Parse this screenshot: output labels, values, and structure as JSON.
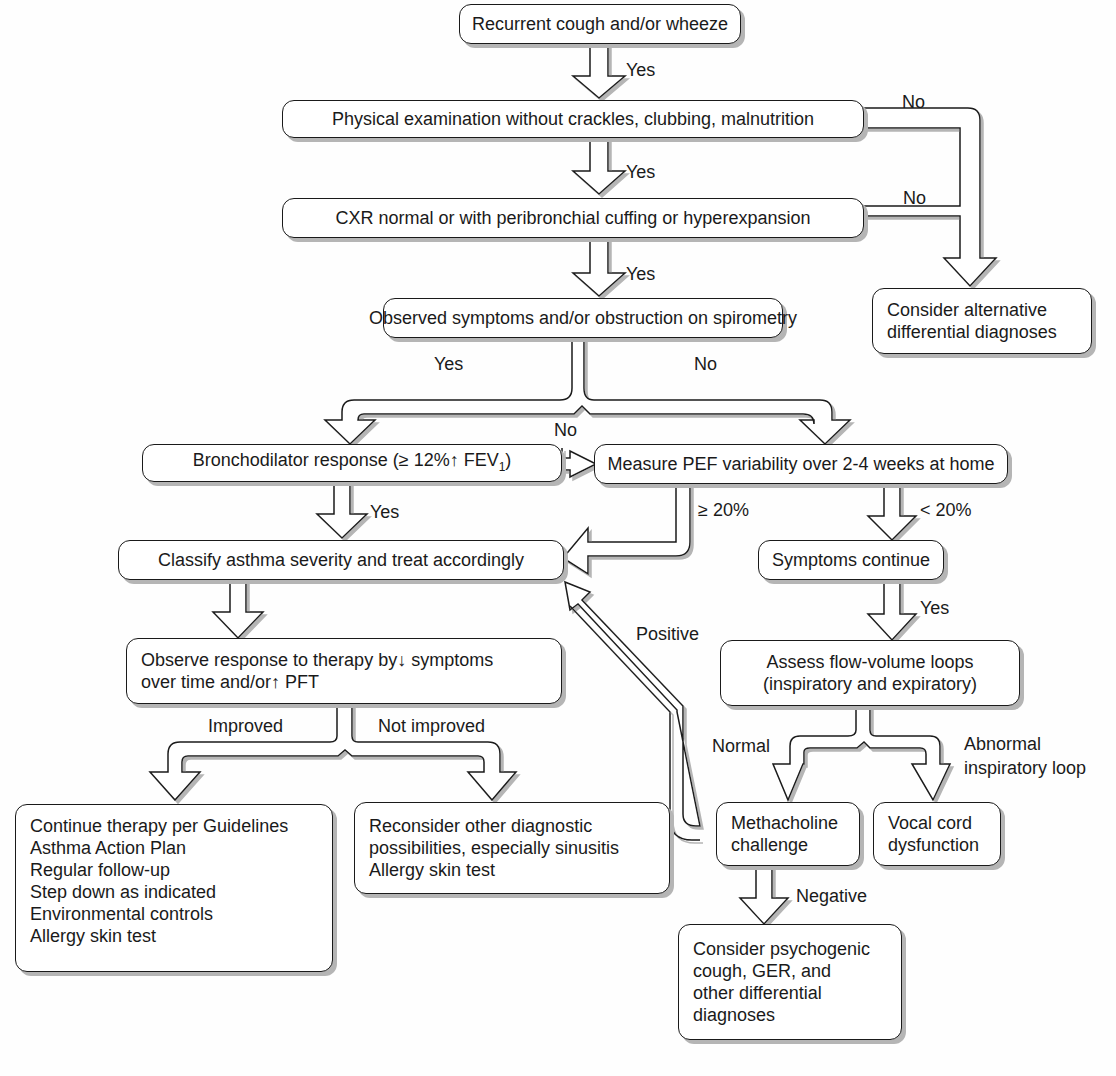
{
  "diagram": {
    "nodes": {
      "start": {
        "text": "Recurrent cough and/or wheeze"
      },
      "physical_exam": {
        "text": "Physical examination without crackles, clubbing, malnutrition"
      },
      "cxr": {
        "text": "CXR normal or with peribronchial cuffing or hyperexpansion"
      },
      "observed": {
        "text": "Observed symptoms and/or obstruction on spirometry"
      },
      "alternative": {
        "lines": [
          "Consider alternative",
          "differential diagnoses"
        ]
      },
      "bronchodilator": {
        "text_pre": "Bronchodilator response (≥ 12%↑ FEV",
        "sub": "1",
        "text_post": ")"
      },
      "pef": {
        "text": "Measure PEF variability over 2-4 weeks at home"
      },
      "classify": {
        "text": "Classify asthma severity and treat accordingly"
      },
      "symptoms_continue": {
        "text": "Symptoms continue"
      },
      "observe_response": {
        "lines": [
          "Observe response to therapy by↓ symptoms",
          "over time and/or↑ PFT"
        ]
      },
      "flow_volume": {
        "lines": [
          "Assess flow-volume loops",
          "(inspiratory and expiratory)"
        ]
      },
      "continue_therapy": {
        "lines": [
          "Continue therapy per Guidelines",
          "Asthma Action Plan",
          "Regular follow-up",
          "Step down as indicated",
          "Environmental controls",
          "Allergy skin test"
        ]
      },
      "reconsider": {
        "lines": [
          "Reconsider other diagnostic",
          "possibilities, especially sinusitis",
          "Allergy skin test"
        ]
      },
      "methacholine": {
        "lines": [
          "Methacholine",
          "challenge"
        ]
      },
      "vocal_cord": {
        "lines": [
          "Vocal cord",
          "dysfunction"
        ]
      },
      "psychogenic": {
        "lines": [
          "Consider psychogenic",
          "cough, GER, and",
          "other differential",
          "diagnoses"
        ]
      }
    },
    "edge_labels": {
      "yes1": "Yes",
      "yes2": "Yes",
      "yes3": "Yes",
      "no1": "No",
      "no2": "No",
      "observed_yes": "Yes",
      "observed_no": "No",
      "broncho_no": "No",
      "broncho_yes": "Yes",
      "pef_ge20": "≥ 20%",
      "pef_lt20": "< 20%",
      "symptoms_yes": "Yes",
      "positive": "Positive",
      "improved": "Improved",
      "not_improved": "Not improved",
      "normal": "Normal",
      "abnormal_1": "Abnormal",
      "abnormal_2": "inspiratory loop",
      "negative": "Negative"
    },
    "colors": {
      "stroke": "#1a1a1a",
      "shadow": "#b5b5b5",
      "fill": "#ffffff",
      "background": "#fefefe"
    }
  }
}
